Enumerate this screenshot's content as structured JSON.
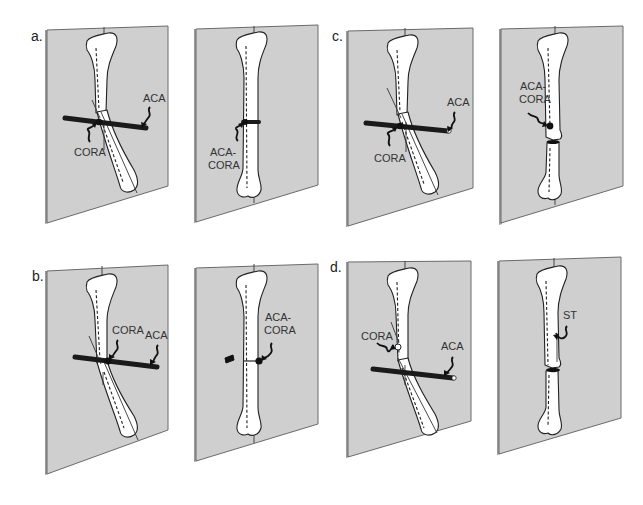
{
  "figure": {
    "panels": [
      {
        "id": "a",
        "label": "a.",
        "left": {
          "annotations": [
            "CORA",
            "ACA"
          ]
        },
        "right": {
          "annotations": [
            "ACA-",
            "CORA"
          ]
        }
      },
      {
        "id": "b",
        "label": "b.",
        "left": {
          "annotations": [
            "CORA",
            "ACA"
          ]
        },
        "right": {
          "annotations": [
            "ACA-",
            "CORA"
          ]
        }
      },
      {
        "id": "c",
        "label": "c.",
        "left": {
          "annotations": [
            "CORA",
            "ACA"
          ]
        },
        "right": {
          "annotations": [
            "ACA-",
            "CORA"
          ]
        }
      },
      {
        "id": "d",
        "label": "d.",
        "left": {
          "annotations": [
            "CORA",
            "ACA"
          ]
        },
        "right": {
          "annotations": [
            "ST"
          ]
        }
      }
    ]
  },
  "colors": {
    "plane_fill": "#cfcfcf",
    "plane_edge": "#9a9a9a",
    "bone_fill": "#ffffff",
    "ink": "#222222"
  }
}
